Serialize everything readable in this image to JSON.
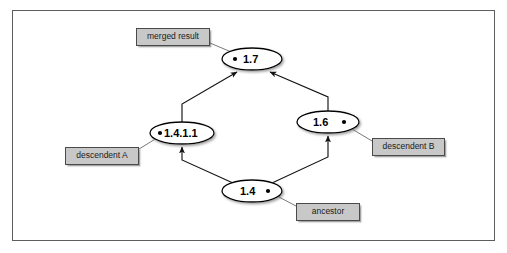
{
  "figure": {
    "type": "version-merge-graph",
    "title": "",
    "background_color": "#ffffff",
    "frame_color": "#5d5d5d",
    "node_fill": "#ffffff",
    "node_stroke": "#000000",
    "callout_fill": "#c8c8c8",
    "callout_stroke": "#4a4a4a"
  },
  "nodes": [
    {
      "id": "node-1-7",
      "label": "1.7",
      "dot_side": "left",
      "cx": 252,
      "cy": 59,
      "rx": 30,
      "ry": 11
    },
    {
      "id": "node-1-4-1-1",
      "label": "1.4.1.1",
      "dot_side": "left",
      "cx": 182,
      "cy": 133,
      "rx": 32,
      "ry": 11
    },
    {
      "id": "node-1-6",
      "label": "1.6",
      "dot_side": "right",
      "cx": 328,
      "cy": 122,
      "rx": 31,
      "ry": 11
    },
    {
      "id": "node-1-4",
      "label": "1.4",
      "dot_side": "right",
      "cx": 252,
      "cy": 191,
      "rx": 30,
      "ry": 11
    }
  ],
  "callouts": [
    {
      "id": "callout-merged-result",
      "label": "merged result",
      "x": 136,
      "y": 28,
      "width": 74,
      "height": 18,
      "target_node": "node-1-7"
    },
    {
      "id": "callout-descendent-a",
      "label": "descendent A",
      "x": 65,
      "y": 147,
      "width": 74,
      "height": 18,
      "target_node": "node-1-4-1-1"
    },
    {
      "id": "callout-descendent-b",
      "label": "descendent B",
      "x": 372,
      "y": 138,
      "width": 73,
      "height": 18,
      "target_node": "node-1-6"
    },
    {
      "id": "callout-ancestor",
      "label": "ancestor",
      "x": 296,
      "y": 203,
      "width": 64,
      "height": 18,
      "target_node": "node-1-4"
    }
  ],
  "edges": [
    {
      "id": "edge-1-4-1-1-to-1-7",
      "from": "node-1-4-1-1",
      "to": "node-1-7",
      "arrow": true
    },
    {
      "id": "edge-1-6-to-1-7",
      "from": "node-1-6",
      "to": "node-1-7",
      "arrow": true
    },
    {
      "id": "edge-1-4-to-1-4-1-1",
      "from": "node-1-4",
      "to": "node-1-4-1-1",
      "arrow": true
    },
    {
      "id": "edge-1-4-to-1-6",
      "from": "node-1-4",
      "to": "node-1-6",
      "arrow": true
    }
  ]
}
